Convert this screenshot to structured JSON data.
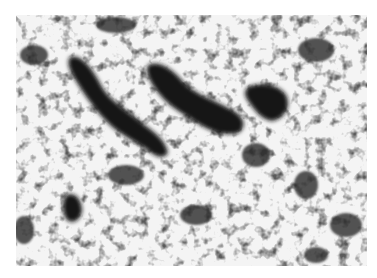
{
  "image": {
    "description": "Grayscale micrograph texture with dark irregular blobs on a light background",
    "colors": {
      "background": "#ffffff",
      "light": "#f4f4f4",
      "mid": "#6a6a6a",
      "dark": "#111111"
    }
  }
}
